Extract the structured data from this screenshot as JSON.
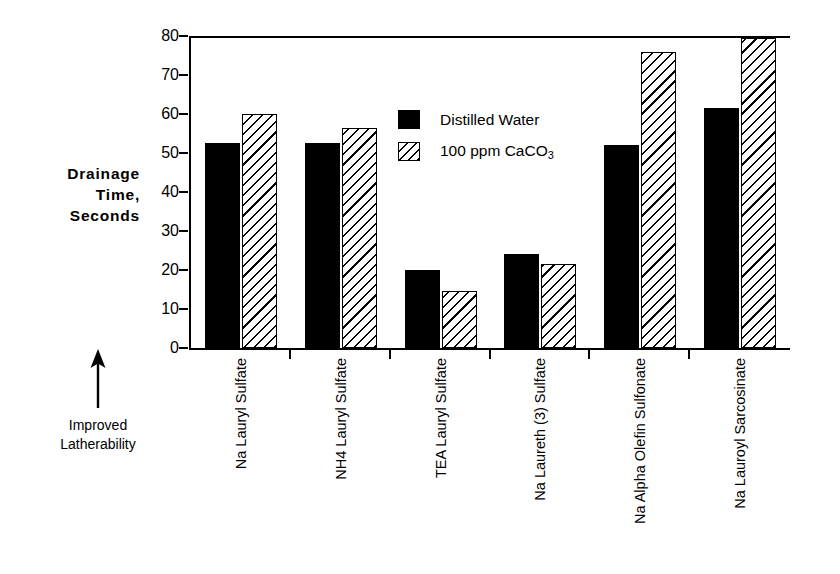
{
  "chart_data": {
    "type": "bar",
    "title": "",
    "xlabel": "",
    "ylabel": "Drainage Time, Seconds",
    "ylim": [
      0,
      80
    ],
    "yticks": [
      0,
      10,
      20,
      30,
      40,
      50,
      60,
      70,
      80
    ],
    "ytick_labels": [
      "0",
      "10",
      "20",
      "30",
      "40",
      "50",
      "60",
      "70",
      "80"
    ],
    "grid": false,
    "legend_position": "upper center",
    "categories": [
      "Na Lauryl Sulfate",
      "NH4 Lauryl Sulfate",
      "TEA Lauryl Sulfate",
      "Na Laureth (3) Sulfate",
      "Na Alpha Olefin Sulfonate",
      "Na Lauroyl Sarcosinate"
    ],
    "series": [
      {
        "name": "Distilled Water",
        "fill": "solid-black",
        "color": "#000000",
        "values": [
          52.5,
          52.5,
          20,
          24,
          52,
          61.5
        ]
      },
      {
        "name": "100 ppm CaCO3",
        "name_display": "100 ppm CaCO",
        "name_subscript": "3",
        "fill": "diagonal-hatch",
        "color": "#000000",
        "values": [
          60,
          56.5,
          14.5,
          21.5,
          76,
          79.5
        ]
      }
    ],
    "annotations": [
      {
        "name": "improved-latherability",
        "text_line1": "Improved",
        "text_line2": "Latherability",
        "arrow_direction": "up"
      }
    ]
  },
  "axis": {
    "y_title_line1": "Drainage",
    "y_title_line2": "Time,",
    "y_title_line3": "Seconds"
  },
  "legend": {
    "entry1_label": "Distilled  Water",
    "entry2_label": "100 ppm CaCO",
    "entry2_subscript": "3"
  },
  "annotation": {
    "line1": "Improved",
    "line2": "Latherability"
  },
  "colors": {
    "ink": "#000000",
    "background": "#ffffff"
  }
}
